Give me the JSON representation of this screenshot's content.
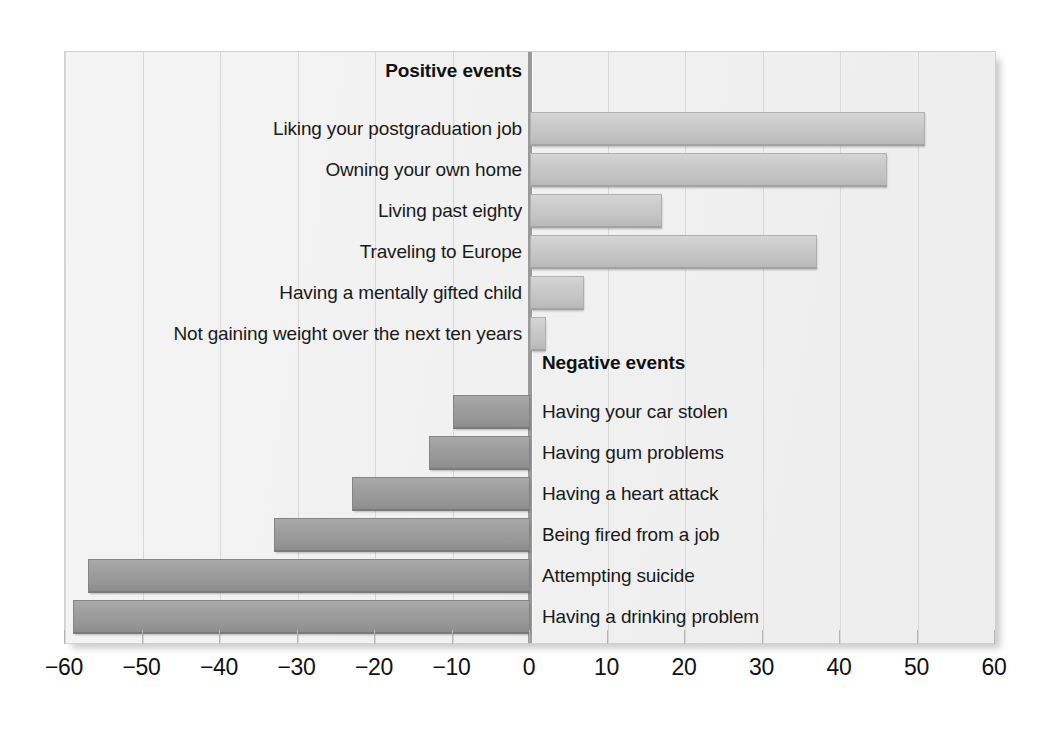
{
  "chart_data": {
    "type": "bar",
    "orientation": "horizontal",
    "title": "",
    "xlabel": "",
    "ylabel": "",
    "xlim": [
      -60,
      60
    ],
    "xticks": [
      -60,
      -50,
      -40,
      -30,
      -20,
      -10,
      0,
      10,
      20,
      30,
      40,
      50,
      60
    ],
    "xticklabels": [
      "−60",
      "−50",
      "−40",
      "−30",
      "−20",
      "−10",
      "0",
      "10",
      "20",
      "30",
      "40",
      "50",
      "60"
    ],
    "grid": true,
    "legend": false,
    "groups": [
      {
        "name": "Positive events",
        "heading": "Positive events",
        "side": "positive",
        "label_side": "left",
        "bar_color": "#c8c8c8",
        "categories": [
          "Liking your postgraduation job",
          "Owning your own home",
          "Living past eighty",
          "Traveling to Europe",
          "Having a mentally gifted child",
          "Not gaining weight over the next ten years"
        ],
        "values": [
          51,
          46,
          17,
          37,
          7,
          2
        ]
      },
      {
        "name": "Negative events",
        "heading": "Negative events",
        "side": "negative",
        "label_side": "right",
        "bar_color": "#9a9a9a",
        "categories": [
          "Having your car stolen",
          "Having gum problems",
          "Having a heart attack",
          "Being fired from a job",
          "Attempting suicide",
          "Having a drinking problem"
        ],
        "values": [
          -10,
          -13,
          -23,
          -33,
          -57,
          -59
        ]
      }
    ]
  },
  "figure": {
    "background_color": "#ffffff",
    "plot_background_color": "#f1f1f1",
    "gridline_color": "#d8d8d8",
    "axis_zero_color": "#9a9a9a",
    "text_color": "#111111"
  }
}
